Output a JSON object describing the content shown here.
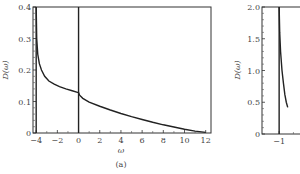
{
  "chart_data": [
    {
      "panel": "(a)",
      "type": "line",
      "title": "",
      "xlabel": "ω",
      "ylabel": "D(ω)",
      "xlim": [
        -4.3,
        12.5
      ],
      "ylim": [
        0,
        0.4
      ],
      "xticks": [
        -4,
        -2,
        0,
        2,
        4,
        6,
        8,
        10,
        12
      ],
      "xtick_labels": [
        "−4",
        "−2",
        "0",
        "2",
        "4",
        "6",
        "8",
        "10",
        "12"
      ],
      "yticks": [
        0,
        0.1,
        0.2,
        0.3,
        0.4
      ],
      "ytick_labels": [
        "0",
        "0.1",
        "0.2",
        "0.3",
        "0.4"
      ],
      "grid": false,
      "vertical_lines": [
        -4,
        0
      ],
      "series": [
        {
          "name": "D(ω)",
          "x": [
            -4.0,
            -3.95,
            -3.85,
            -3.7,
            -3.5,
            -3.2,
            -2.8,
            -2.3,
            -1.8,
            -1.2,
            -0.6,
            -0.1,
            0.0,
            0.1,
            0.4,
            1.0,
            2.0,
            3.0,
            4.0,
            5.0,
            6.0,
            7.0,
            8.0,
            9.0,
            10.0,
            11.0,
            12.0
          ],
          "y": [
            0.4,
            0.3,
            0.25,
            0.22,
            0.2,
            0.18,
            0.165,
            0.155,
            0.147,
            0.14,
            0.134,
            0.129,
            0.128,
            0.12,
            0.11,
            0.098,
            0.085,
            0.073,
            0.062,
            0.052,
            0.043,
            0.034,
            0.026,
            0.019,
            0.012,
            0.006,
            0.002
          ]
        }
      ]
    },
    {
      "panel": "(b)",
      "type": "line",
      "title": "",
      "xlabel": "",
      "ylabel": "D(ω)",
      "xlim": [
        -1.6,
        0.5
      ],
      "ylim": [
        0,
        2.0
      ],
      "xticks": [
        -1,
        0
      ],
      "xtick_labels": [
        "−1",
        "0"
      ],
      "yticks": [
        0,
        0.5,
        1.0,
        1.5,
        2.0
      ],
      "ytick_labels": [
        "0",
        "0.5",
        "1.0",
        "1.5",
        "2.0"
      ],
      "grid": false,
      "vertical_lines": [
        -1
      ],
      "series": [
        {
          "name": "D(ω)",
          "x": [
            -1.0,
            -0.98,
            -0.95,
            -0.9,
            -0.85,
            -0.8,
            -0.75,
            -0.7
          ],
          "y": [
            2.0,
            1.6,
            1.3,
            1.0,
            0.8,
            0.62,
            0.5,
            0.42
          ]
        }
      ]
    }
  ],
  "captions": {
    "panel_a": "(a)"
  },
  "labels": {
    "a_ylabel": "D(ω)",
    "a_xlabel": "ω",
    "b_ylabel": "D(ω)"
  }
}
